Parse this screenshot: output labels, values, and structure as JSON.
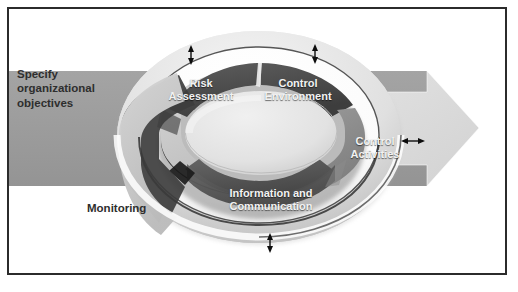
{
  "diagram": {
    "type": "cycle-donut",
    "external_label": "Specify\norganizational\nobjectives",
    "external_label_lines": [
      "Specify",
      "organizational",
      "objectives"
    ],
    "components": [
      {
        "id": "risk-assessment",
        "label": "Risk\nAssessment",
        "lines": [
          "Risk",
          "Assessment"
        ],
        "tone": "dark",
        "color": "#4f4f4f",
        "text_color": "#f2f2f2",
        "position": "upper-left"
      },
      {
        "id": "control-environment",
        "label": "Control\nEnvironment",
        "lines": [
          "Control",
          "Environment"
        ],
        "tone": "dark",
        "color": "#4a4a4a",
        "text_color": "#f2f2f2",
        "position": "upper-right"
      },
      {
        "id": "control-activities",
        "label": "Control\nActivities",
        "lines": [
          "Control",
          "Activities"
        ],
        "tone": "mid",
        "color": "#8e8e8e",
        "text_color": "#f2f2f2",
        "position": "right"
      },
      {
        "id": "information-communication",
        "label": "Information and\nCommunication",
        "lines": [
          "Information and",
          "Communication"
        ],
        "tone": "dark",
        "color": "#565656",
        "text_color": "#f2f2f2",
        "position": "bottom"
      },
      {
        "id": "monitoring",
        "label": "Monitoring",
        "lines": [
          "Monitoring"
        ],
        "tone": "light",
        "color": "#c9c9c9",
        "text_color": "#2e2e2e",
        "position": "left"
      }
    ],
    "arrows": [
      {
        "id": "arrow-top-left",
        "orientation": "vertical",
        "heads": "double",
        "x": 189,
        "y1": 45,
        "y2": 59
      },
      {
        "id": "arrow-top-right",
        "orientation": "vertical",
        "heads": "double",
        "x": 313,
        "y1": 44,
        "y2": 59
      },
      {
        "id": "arrow-right",
        "orientation": "horizontal",
        "heads": "double",
        "y": 139,
        "x1": 398,
        "x2": 420
      },
      {
        "id": "arrow-bottom",
        "orientation": "vertical",
        "heads": "double",
        "x": 268,
        "y1": 231,
        "y2": 249
      }
    ],
    "flow_band": {
      "id": "objectives-band",
      "direction": "left-to-right",
      "color": "#9c9c9c"
    },
    "flow_arrow": {
      "id": "outcome-arrow",
      "direction": "right",
      "color": "#dcdcdc"
    },
    "colors": {
      "background": "#ffffff",
      "frame_border": "#2b2b2b",
      "band": "#9c9c9c",
      "outer_ring_light": "#e7e7e7",
      "outer_ring_shadow": "#b9b9b9",
      "ring_outline_dark": "#3a3a3a",
      "inner_hub": "#e4e4e4",
      "arrow_fill": "#dcdcdc",
      "arrow_stroke": "#111111"
    }
  }
}
